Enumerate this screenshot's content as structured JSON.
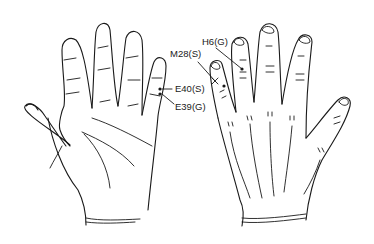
{
  "figure": {
    "left_hand": {
      "view": "palm"
    },
    "right_hand": {
      "view": "dorsum"
    },
    "points": [
      {
        "id": "E40",
        "label": "E40(S)",
        "hand": "palm",
        "finger": "little"
      },
      {
        "id": "E39",
        "label": "E39(G)",
        "hand": "palm",
        "finger": "little"
      },
      {
        "id": "M28",
        "label": "M28(S)",
        "hand": "dorsum",
        "finger": "little"
      },
      {
        "id": "H6",
        "label": "H6(G)",
        "hand": "dorsum",
        "finger": "ring"
      }
    ]
  },
  "colors": {
    "ink": "#1a1a1a",
    "background": "#ffffff"
  }
}
